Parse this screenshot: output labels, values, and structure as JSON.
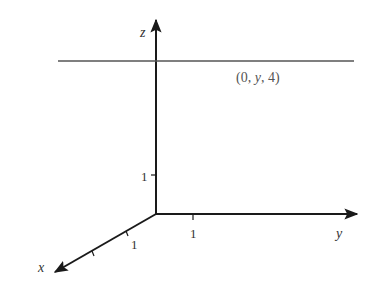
{
  "diagram": {
    "type": "3d-axes",
    "axes": {
      "x": {
        "label": "x",
        "tick_label": "1"
      },
      "y": {
        "label": "y",
        "tick_label": "1"
      },
      "z": {
        "label": "z",
        "tick_label": "1"
      }
    },
    "line": {
      "description": "line parallel to y-axis at x=0, z=4",
      "label_open": "(0, ",
      "label_var": "y",
      "label_close": ", 4)"
    },
    "colors": {
      "axis": "#1a1a1a",
      "line": "#555555",
      "text": "#333333",
      "background": "#ffffff"
    }
  }
}
